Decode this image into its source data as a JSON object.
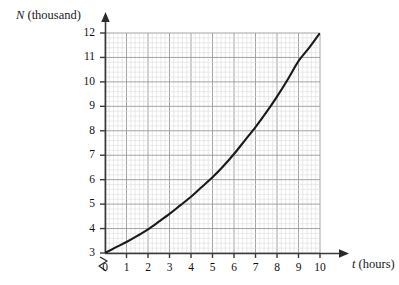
{
  "figure": {
    "y_axis_title": "N (thousand)",
    "x_axis_title_symbol": "t",
    "x_axis_title_unit": "(hours)",
    "axis_break_symbol": "zigzag-break"
  },
  "chart_data": {
    "type": "line",
    "title": "",
    "xlabel": "t (hours)",
    "ylabel": "N (thousand)",
    "xlim": [
      0,
      10
    ],
    "ylim": [
      3,
      12
    ],
    "y_axis_break": true,
    "y_axis_break_note": "axis broken between 0 and 3",
    "grid": true,
    "grid_major_step_x": 1,
    "grid_major_step_y": 1,
    "grid_minor_divisions": 5,
    "legend": "none",
    "x_tick_labels": [
      "0",
      "1",
      "2",
      "3",
      "4",
      "5",
      "6",
      "7",
      "8",
      "9",
      "10"
    ],
    "y_tick_labels": [
      "3",
      "4",
      "5",
      "6",
      "7",
      "8",
      "9",
      "10",
      "11",
      "12"
    ],
    "series": [
      {
        "name": "N(t)",
        "x": [
          0,
          0.5,
          1,
          1.5,
          2,
          2.5,
          3,
          3.5,
          4,
          4.5,
          5,
          5.5,
          6,
          6.5,
          7,
          7.5,
          8,
          8.5,
          9,
          9.5,
          10
        ],
        "values": [
          3.0,
          3.23,
          3.45,
          3.7,
          3.97,
          4.28,
          4.6,
          4.95,
          5.3,
          5.7,
          6.1,
          6.55,
          7.05,
          7.6,
          8.15,
          8.75,
          9.4,
          10.1,
          10.85,
          11.4,
          12.0
        ]
      }
    ]
  },
  "colors": {
    "curve": "#1a1a1a",
    "axis": "#3a3a3a",
    "grid_major": "#9a9a9a",
    "grid_minor": "#d8d8d8",
    "text": "#101010"
  },
  "x_ticks": [
    {
      "label": "0",
      "value": 0
    },
    {
      "label": "1",
      "value": 1
    },
    {
      "label": "2",
      "value": 2
    },
    {
      "label": "3",
      "value": 3
    },
    {
      "label": "4",
      "value": 4
    },
    {
      "label": "5",
      "value": 5
    },
    {
      "label": "6",
      "value": 6
    },
    {
      "label": "7",
      "value": 7
    },
    {
      "label": "8",
      "value": 8
    },
    {
      "label": "9",
      "value": 9
    },
    {
      "label": "10",
      "value": 10
    }
  ],
  "y_ticks": [
    {
      "label": "12",
      "value": 12
    },
    {
      "label": "11",
      "value": 11
    },
    {
      "label": "10",
      "value": 10
    },
    {
      "label": "9",
      "value": 9
    },
    {
      "label": "8",
      "value": 8
    },
    {
      "label": "7",
      "value": 7
    },
    {
      "label": "6",
      "value": 6
    },
    {
      "label": "5",
      "value": 5
    },
    {
      "label": "4",
      "value": 4
    },
    {
      "label": "3",
      "value": 3
    }
  ]
}
